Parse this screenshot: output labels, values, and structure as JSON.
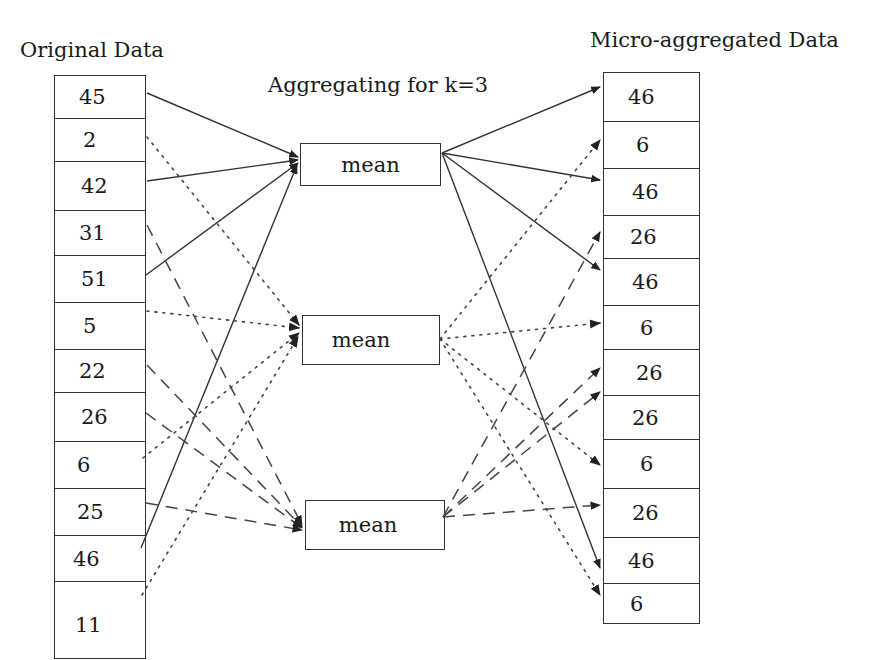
{
  "titles": {
    "original": "Original Data",
    "aggregating": "Aggregating for k=3",
    "micro": "Micro-aggregated Data"
  },
  "original_data": [
    "45",
    "2",
    "42",
    "31",
    "51",
    "5",
    "22",
    "26",
    "6",
    "25",
    "46",
    "11"
  ],
  "aggregators": [
    {
      "label": "mean",
      "line_style": "solid",
      "inputs": [
        "45",
        "42",
        "51",
        "46"
      ],
      "output": "46"
    },
    {
      "label": "mean",
      "line_style": "dotted",
      "inputs": [
        "2",
        "5",
        "6",
        "11"
      ],
      "output": "6"
    },
    {
      "label": "mean",
      "line_style": "dashed",
      "inputs": [
        "31",
        "22",
        "26",
        "25"
      ],
      "output": "26"
    }
  ],
  "micro_data": [
    "46",
    "6",
    "46",
    "26",
    "46",
    "6",
    "26",
    "26",
    "6",
    "26",
    "46",
    "6"
  ]
}
